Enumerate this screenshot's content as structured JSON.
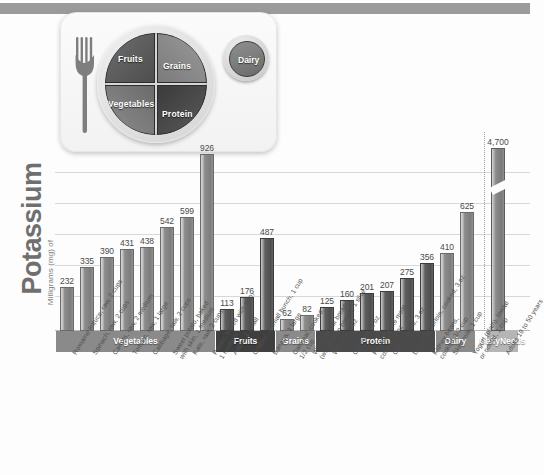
{
  "axis": {
    "title_main": "Potassium",
    "title_sub": "Milligrams (mg) of"
  },
  "plate": {
    "fruits": "Fruits",
    "grains": "Grains",
    "vegetables": "Vegetables",
    "protein": "Protein",
    "dairy": "Dairy"
  },
  "categories_band": [
    {
      "label": "Vegetables",
      "color": "#8a8a8a"
    },
    {
      "label": "Fruits",
      "color": "#3f3f3f"
    },
    {
      "label": "Grains",
      "color": "#8a8a8a"
    },
    {
      "label": "Protein",
      "color": "#4a4a4a"
    },
    {
      "label": "Dairy",
      "color": "#8a8a8a"
    },
    {
      "label": "Daily\nNeeds",
      "color": "#b5b5b5"
    }
  ],
  "chart_data": {
    "type": "bar",
    "title": "Potassium",
    "xlabel": "",
    "ylabel": "Milligrams (mg) of Potassium",
    "ylim": [
      0,
      1000
    ],
    "grid": true,
    "legend": "none",
    "note": "Daily Needs bar is truncated with a break mark; its true value is 4,700 mg",
    "categories": [
      "Romaine lettuce, raw, 2 cups",
      "Spinach, raw, 2 cups",
      "Carrots, raw, 2 medium",
      "Tomato, raw, 1 large",
      "Cabbage, raw, 2 cups",
      "Sweet potato, baked with skin, 1 medium",
      "Kale, raw, 2 cups",
      "Potato, baked with skin, 1 medium",
      "Apple, 1 small",
      "Grapes, 1 small bunch, 1 cup",
      "Banana, 1 large",
      "Oatmeal, cooked, 1/2 cup",
      "Whole wheat bread (wheat bran bread), 1 slice",
      "Walnuts, 1 oz",
      "Cashews, 1 oz",
      "Poultry, white meat, cooked, 3 oz",
      "Cod, cooked, 3 oz",
      "Lean beef sirloin, cooked, 3 oz",
      "Kidney beans, cooked, 1/2 cup",
      "Skim milk, 1 cup",
      "Yogurt (plain), lowfat or nonfat, 1 cup",
      "Adults 19 to 50 years"
    ],
    "values": [
      232,
      335,
      390,
      431,
      438,
      542,
      599,
      926,
      113,
      176,
      487,
      62,
      82,
      125,
      160,
      201,
      207,
      275,
      356,
      410,
      625,
      4700
    ],
    "value_labels": [
      "232",
      "335",
      "390",
      "431",
      "438",
      "542",
      "599",
      "926",
      "113",
      "176",
      "487",
      "62",
      "82",
      "125",
      "160",
      "201",
      "207",
      "275",
      "356",
      "410",
      "625",
      "4,700"
    ],
    "groups": [
      {
        "name": "Vegetables",
        "count": 8
      },
      {
        "name": "Fruits",
        "count": 3
      },
      {
        "name": "Grains",
        "count": 2
      },
      {
        "name": "Protein",
        "count": 6
      },
      {
        "name": "Dairy",
        "count": 2
      },
      {
        "name": "Daily Needs",
        "count": 1
      }
    ]
  },
  "xaxis_labels": [
    [
      "Romaine lettuce, raw, 2 cups"
    ],
    [
      "Spinach, raw, 2 cups"
    ],
    [
      "Carrots, raw, 2 medium"
    ],
    [
      "Tomato, raw, 1 large"
    ],
    [
      "Cabbage, raw, 2 cups"
    ],
    [
      "Sweet potato, baked",
      "with skin, 1 medium"
    ],
    [
      "Kale, raw, 2 cups"
    ],
    [
      "Potato, baked with skin,",
      "1 medium"
    ],
    [
      "Apple, 1 small"
    ],
    [
      "Grapes, 1 small bunch, 1 cup"
    ],
    [
      "Banana, 1 large"
    ],
    [
      "Oatmeal, cooked,",
      "1/2 cup"
    ],
    [
      "Whole wheat bread",
      "(wheat bran bread), 1 slice"
    ],
    [
      "Walnuts, 1 oz"
    ],
    [
      "Cashews, 1 oz"
    ],
    [
      "Poultry, white meat,",
      "cooked, 3 oz"
    ],
    [
      "Cod, cooked, 3 oz"
    ],
    [
      "Lean beef sirloin, cooked, 3 oz"
    ],
    [
      "Kidney beans,",
      "cooked, 1/2 cup"
    ],
    [
      "Skim milk, 1 cup"
    ],
    [
      "Yogurt (plain), lowfat",
      "or nonfat, 1 cup"
    ],
    [
      "Adults 19 to 50 years"
    ]
  ]
}
